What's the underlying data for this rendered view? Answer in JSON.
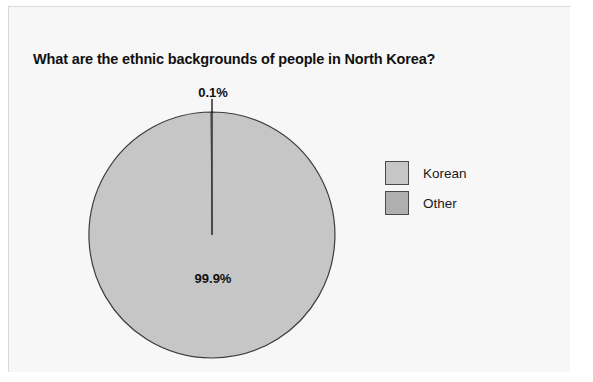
{
  "figure": {
    "width": 593,
    "height": 382,
    "page_background": "#ffffff",
    "panel_background": "#f7f7f7",
    "panel_border": "#d9d9d9"
  },
  "title": "What are the ethnic backgrounds of people in North Korea?",
  "legend": {
    "position": "right",
    "items": [
      {
        "label": "Korean",
        "color": "#c6c6c6",
        "edge": "#4a4a4a"
      },
      {
        "label": "Other",
        "color": "#b0b0b0",
        "edge": "#4a4a4a"
      }
    ]
  },
  "labels": {
    "korean": "99.9%",
    "other": "0.1%"
  },
  "geometry": {
    "center_x": 212,
    "center_y": 235,
    "radius": 123,
    "leader_line_x": 212,
    "leader_line_top": 99,
    "leader_line_bottom": 113
  },
  "chart_data": {
    "type": "pie",
    "title": "What are the ethnic backgrounds of people in North Korea?",
    "xlabel": "",
    "ylabel": "",
    "categories": [
      "Korean",
      "Other"
    ],
    "values": [
      99.9,
      0.1
    ],
    "value_labels": [
      "99.9%",
      "0.1%"
    ],
    "colors": [
      "#c6c6c6",
      "#b0b0b0"
    ],
    "units": "percent",
    "start_angle_deg": 90,
    "direction": "clockwise",
    "legend_position": "right",
    "grid": false,
    "annotations": [
      {
        "text": "0.1%",
        "points_to": "Other",
        "placement": "outside-top"
      },
      {
        "text": "99.9%",
        "points_to": "Korean",
        "placement": "inside"
      }
    ]
  }
}
